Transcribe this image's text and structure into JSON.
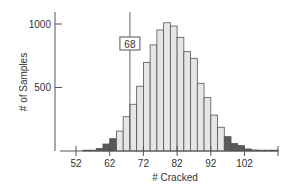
{
  "chart_data": {
    "type": "bar",
    "title": "",
    "xlabel": "# Cracked",
    "ylabel": "# of Samples",
    "x_ticks": [
      52,
      62,
      72,
      82,
      92,
      102
    ],
    "y_ticks": [
      500,
      1000
    ],
    "ylim": [
      0,
      1050
    ],
    "xlim": [
      50,
      112
    ],
    "grid": false,
    "bin_width": 2,
    "bins": [
      {
        "start": 54,
        "end": 56,
        "value": 4,
        "shade": "dark"
      },
      {
        "start": 56,
        "end": 58,
        "value": 6,
        "shade": "dark"
      },
      {
        "start": 58,
        "end": 60,
        "value": 20,
        "shade": "dark"
      },
      {
        "start": 60,
        "end": 62,
        "value": 55,
        "shade": "dark"
      },
      {
        "start": 62,
        "end": 64,
        "value": 97,
        "shade": "dark"
      },
      {
        "start": 64,
        "end": 66,
        "value": 157,
        "shade": "light"
      },
      {
        "start": 66,
        "end": 68,
        "value": 270,
        "shade": "light"
      },
      {
        "start": 68,
        "end": 70,
        "value": 368,
        "shade": "light"
      },
      {
        "start": 70,
        "end": 72,
        "value": 510,
        "shade": "light"
      },
      {
        "start": 72,
        "end": 74,
        "value": 698,
        "shade": "light"
      },
      {
        "start": 74,
        "end": 76,
        "value": 835,
        "shade": "light"
      },
      {
        "start": 76,
        "end": 78,
        "value": 953,
        "shade": "light"
      },
      {
        "start": 78,
        "end": 80,
        "value": 1010,
        "shade": "light"
      },
      {
        "start": 80,
        "end": 82,
        "value": 984,
        "shade": "light"
      },
      {
        "start": 82,
        "end": 84,
        "value": 895,
        "shade": "light"
      },
      {
        "start": 84,
        "end": 86,
        "value": 782,
        "shade": "light"
      },
      {
        "start": 86,
        "end": 88,
        "value": 730,
        "shade": "light"
      },
      {
        "start": 88,
        "end": 90,
        "value": 533,
        "shade": "light"
      },
      {
        "start": 90,
        "end": 92,
        "value": 420,
        "shade": "light"
      },
      {
        "start": 92,
        "end": 94,
        "value": 283,
        "shade": "light"
      },
      {
        "start": 94,
        "end": 96,
        "value": 187,
        "shade": "light"
      },
      {
        "start": 96,
        "end": 98,
        "value": 113,
        "shade": "dark"
      },
      {
        "start": 98,
        "end": 100,
        "value": 60,
        "shade": "dark"
      },
      {
        "start": 100,
        "end": 102,
        "value": 42,
        "shade": "dark"
      },
      {
        "start": 102,
        "end": 104,
        "value": 16,
        "shade": "dark"
      },
      {
        "start": 104,
        "end": 106,
        "value": 8,
        "shade": "dark"
      },
      {
        "start": 106,
        "end": 108,
        "value": 4,
        "shade": "dark"
      },
      {
        "start": 108,
        "end": 110,
        "value": 3,
        "shade": "dark"
      },
      {
        "start": 110,
        "end": 112,
        "value": 2,
        "shade": "dark"
      }
    ],
    "annotations": [
      {
        "type": "vertical_line",
        "x": 68,
        "label": "68"
      }
    ],
    "colors": {
      "light_fill": "#e6e6e6",
      "dark_fill": "#5a5a5a",
      "bar_stroke": "#555555",
      "axis": "#555555",
      "text": "#333333"
    }
  }
}
